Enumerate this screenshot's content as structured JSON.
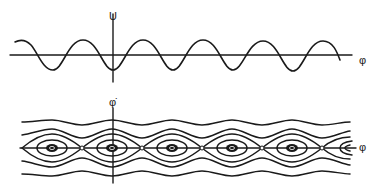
{
  "top_plot": {
    "title": "Potential energy",
    "y_axis_label": "U",
    "x_axis_label": "φ",
    "curve": "cosine, minimum at origin, period ≈ 60px"
  },
  "bottom_plot": {
    "title": "Phase portrait",
    "y_axis_label": "φ̇",
    "x_axis_label": "φ",
    "centers_count": 5,
    "saddles_count": 5
  },
  "colors": {
    "stroke": "#1a1a1a",
    "background": "#ffffff"
  }
}
